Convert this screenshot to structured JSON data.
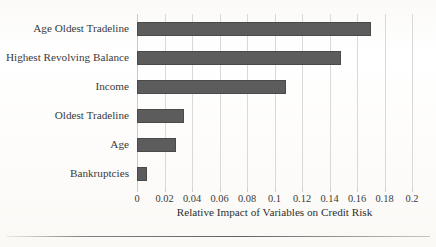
{
  "chart_data": {
    "type": "bar",
    "orientation": "horizontal",
    "title": "",
    "xlabel": "Relative Impact of Variables on Credit Risk",
    "ylabel": "",
    "xlim": [
      0,
      0.2
    ],
    "grid": true,
    "legend": "none",
    "bar_color": "#5c5c5c",
    "categories": [
      "Age Oldest Tradeline",
      "Highest Revolving Balance",
      "Income",
      "Oldest Tradeline",
      "Age",
      "Bankruptcies"
    ],
    "values": [
      0.17,
      0.148,
      0.108,
      0.034,
      0.028,
      0.007
    ],
    "xticks": [
      0,
      0.02,
      0.04,
      0.06,
      0.08,
      0.1,
      0.12,
      0.14,
      0.16,
      0.18,
      0.2
    ],
    "xtick_labels": [
      "0",
      "0.02",
      "0.04",
      "0.06",
      "0.08",
      "0.1",
      "0.12",
      "0.14",
      "0.16",
      "0.18",
      "0.2"
    ]
  }
}
